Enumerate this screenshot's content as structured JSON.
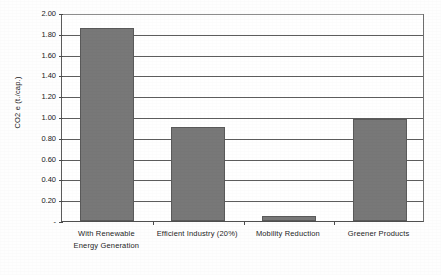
{
  "chart_data": {
    "type": "bar",
    "title": "",
    "xlabel": "",
    "ylabel": "CO2 e (t./cap.)",
    "categories": [
      "With Renewable Energy Generation",
      "Efficient Industry (20%)",
      "Mobility Reduction",
      "Greener Products"
    ],
    "category_lines": [
      [
        "With Renewable",
        "Energy Generation"
      ],
      [
        "Efficient Industry (20%)"
      ],
      [
        "Mobility Reduction"
      ],
      [
        "Greener Products"
      ]
    ],
    "values": [
      1.86,
      0.9,
      0.05,
      0.98
    ],
    "ylim": [
      0,
      2.0
    ],
    "ytick_values": [
      2.0,
      1.8,
      1.6,
      1.4,
      1.2,
      1.0,
      0.8,
      0.6,
      0.4,
      0.2,
      0
    ],
    "ytick_labels": [
      "2.00",
      "1.80",
      "1.60",
      "1.40",
      "1.20",
      "1.00",
      "0.80",
      "0.60",
      "0.40",
      "0.20",
      "-"
    ],
    "grid": true,
    "legend": "none",
    "series_color": "#787878",
    "axis_color": "#4f4f4f",
    "gridline_color": "#5d5d5d",
    "plot_background": "#ffffff"
  }
}
